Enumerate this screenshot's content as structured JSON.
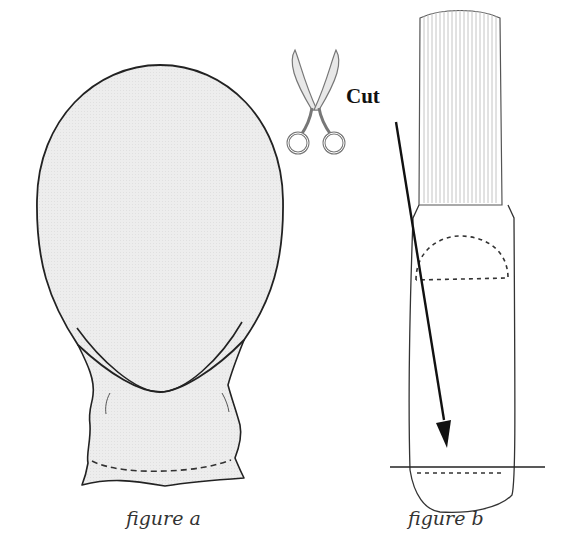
{
  "diagram": {
    "figure_a": {
      "caption": "figure a",
      "fill_color": "#ececec",
      "outline_color": "#222222"
    },
    "figure_b": {
      "caption": "figure b",
      "outline_color": "#333333",
      "rib_color": "#b0b0b0"
    },
    "cut": {
      "label": "Cut",
      "icon": "scissors-icon",
      "arrow_color": "#111111"
    }
  }
}
